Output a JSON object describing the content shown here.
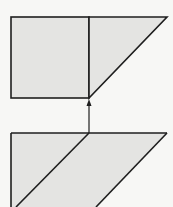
{
  "diagram": {
    "colors": {
      "background": "#f7f7f5",
      "fill": "#e4e4e2",
      "stroke": "#1e1e1e"
    },
    "top_figure": {
      "rectangle": {
        "x": 11,
        "y": 17,
        "width": 78,
        "height": 81
      },
      "triangle": {
        "points": [
          [
            89,
            17
          ],
          [
            167,
            17
          ],
          [
            89,
            98
          ]
        ]
      }
    },
    "arrow": {
      "x": 89,
      "from_y": 133,
      "to_y": 100,
      "direction": "up"
    },
    "bottom_figure": {
      "outline": [
        [
          11,
          133
        ],
        [
          167,
          133
        ],
        [
          96,
          207
        ],
        [
          11,
          207
        ]
      ],
      "diagonal_cut": [
        [
          89,
          133
        ],
        [
          16,
          207
        ]
      ]
    }
  }
}
